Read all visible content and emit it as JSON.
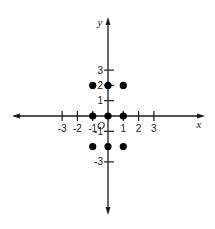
{
  "chart_data": {
    "type": "scatter",
    "title": "",
    "xlabel": "x",
    "ylabel": "y",
    "origin_label": "O",
    "xlim": [
      -6,
      6
    ],
    "ylim": [
      -6.5,
      6
    ],
    "grid": false,
    "x_ticks": [
      {
        "value": -3,
        "label": "-3"
      },
      {
        "value": -2,
        "label": "-2"
      },
      {
        "value": -1,
        "label": "-1"
      },
      {
        "value": 1,
        "label": "1"
      },
      {
        "value": 2,
        "label": "2"
      },
      {
        "value": 3,
        "label": "3"
      }
    ],
    "y_ticks": [
      {
        "value": 3,
        "label": "3"
      },
      {
        "value": 2,
        "label": "2"
      },
      {
        "value": 1,
        "label": "1"
      },
      {
        "value": -1,
        "label": "-1"
      },
      {
        "value": -3,
        "label": "-3"
      }
    ],
    "points": [
      {
        "x": -1,
        "y": 2
      },
      {
        "x": 0,
        "y": 2
      },
      {
        "x": 1,
        "y": 2
      },
      {
        "x": -1,
        "y": 0
      },
      {
        "x": 0,
        "y": 0
      },
      {
        "x": 1,
        "y": 0
      },
      {
        "x": -1,
        "y": -2
      },
      {
        "x": 0,
        "y": -2
      },
      {
        "x": 1,
        "y": -2
      }
    ]
  },
  "colors": {
    "axis": "#1a1a1a",
    "point": "#000000"
  }
}
